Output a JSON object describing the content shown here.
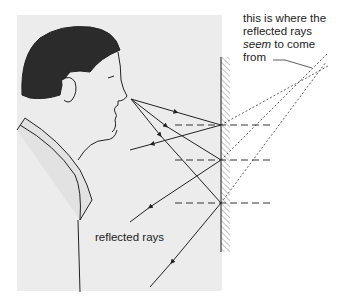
{
  "diagram": {
    "labels": {
      "virtual_image_caption_line1": "this is where the",
      "virtual_image_caption_line2": "reflected rays",
      "virtual_image_caption_em": "seem",
      "virtual_image_caption_line3_rest": " to come",
      "virtual_image_caption_line4": "from",
      "reflected_rays": "reflected rays"
    },
    "colors": {
      "background_panel": "#ececec",
      "hair": "#2b2b2b",
      "line": "#333333",
      "mirror_hatch": "#888888"
    },
    "elements": {
      "person": "man-profile-facing-right",
      "mirror": "plane-mirror-hatched",
      "source_point": [
        131,
        99
      ],
      "virtual_image_point": [
        313,
        68
      ],
      "reflection_points": [
        [
          221,
          125
        ],
        [
          221,
          160
        ],
        [
          221,
          203
        ]
      ],
      "normals": "dashed-horizontal-at-reflection-points",
      "reflected_ray_ends": [
        [
          130,
          150
        ],
        [
          130,
          222
        ],
        [
          150,
          287
        ]
      ]
    }
  }
}
